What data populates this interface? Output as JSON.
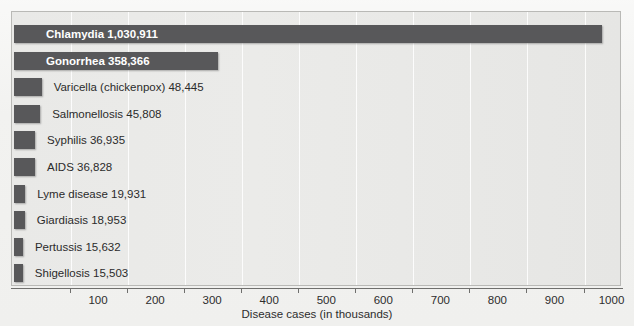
{
  "chart_data": {
    "type": "bar",
    "orientation": "horizontal",
    "title": "",
    "subtitle": "",
    "xlabel": "Disease cases (in thousands)",
    "ylabel": "",
    "xlim": [
      0,
      1070
    ],
    "xticks": [
      100,
      200,
      300,
      400,
      500,
      600,
      700,
      800,
      900,
      1000
    ],
    "xtick_labels": [
      "100",
      "200",
      "300",
      "400",
      "500",
      "600",
      "700",
      "800",
      "900",
      "1000"
    ],
    "units": "thousands of cases",
    "grid": true,
    "grid_axis": "x",
    "legend": false,
    "bar_color": "#58585a",
    "plot_background": "#e9e9e7",
    "categories": [
      "Chlamydia",
      "Gonorrhea",
      "Varicella (chickenpox)",
      "Salmonellosis",
      "Syphilis",
      "AIDS",
      "Lyme disease",
      "Giardiasis",
      "Pertussis",
      "Shigellosis"
    ],
    "values": [
      1030911,
      358366,
      48445,
      45808,
      36935,
      36828,
      19931,
      18953,
      15632,
      15503
    ],
    "values_in_thousands": [
      1030.911,
      358.366,
      48.445,
      45.808,
      36.935,
      36.828,
      19.931,
      18.953,
      15.632,
      15.503
    ],
    "value_labels": [
      "1,030,911",
      "358,366",
      "48,445",
      "36,935",
      "36,828",
      "19,931",
      "18,953",
      "15,632",
      "15,503",
      "45,808"
    ],
    "bars": [
      {
        "name": "Chlamydia",
        "value": 1030911,
        "label": "Chlamydia  1,030,911",
        "label_position": "inside"
      },
      {
        "name": "Gonorrhea",
        "value": 358366,
        "label": "Gonorrhea  358,366",
        "label_position": "inside"
      },
      {
        "name": "Varicella (chickenpox)",
        "value": 48445,
        "label": "Varicella (chickenpox)  48,445",
        "label_position": "outside"
      },
      {
        "name": "Salmonellosis",
        "value": 45808,
        "label": "Salmonellosis  45,808",
        "label_position": "outside"
      },
      {
        "name": "Syphilis",
        "value": 36935,
        "label": "Syphilis  36,935",
        "label_position": "outside"
      },
      {
        "name": "AIDS",
        "value": 36828,
        "label": "AIDS  36,828",
        "label_position": "outside"
      },
      {
        "name": "Lyme disease",
        "value": 19931,
        "label": "Lyme disease 19,931",
        "label_position": "outside"
      },
      {
        "name": "Giardiasis",
        "value": 18953,
        "label": "Giardiasis  18,953",
        "label_position": "outside"
      },
      {
        "name": "Pertussis",
        "value": 15632,
        "label": "Pertussis  15,632",
        "label_position": "outside"
      },
      {
        "name": "Shigellosis",
        "value": 15503,
        "label": "Shigellosis 15,503",
        "label_position": "outside"
      }
    ]
  },
  "artifacts": {
    "ghost_a": "Rate of New Cases",
    "ghost_b": "of Reportable",
    "ghost_c": "Diseases",
    "ghost_d": "scan bleed-through"
  }
}
